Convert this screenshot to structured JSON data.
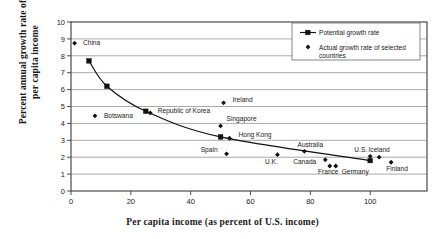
{
  "chart_data": {
    "type": "scatter",
    "title": "",
    "xlabel": "Per capita income (as percent of U.S. income)",
    "ylabel_line1": "Percent annual growth rate of",
    "ylabel_line2": "per capita income",
    "xlim": [
      0,
      119
    ],
    "ylim": [
      0,
      10
    ],
    "xticks": [
      0,
      20,
      40,
      60,
      80,
      100
    ],
    "yticks": [
      0,
      1,
      2,
      3,
      4,
      5,
      6,
      7,
      8,
      9,
      10
    ],
    "grid": "horizontal",
    "legend_position": "top-right",
    "series": [
      {
        "name": "Potential growth rate",
        "marker": "square",
        "line": true,
        "points": [
          {
            "x": 6,
            "y": 7.7
          },
          {
            "x": 12,
            "y": 6.2
          },
          {
            "x": 25,
            "y": 4.72
          },
          {
            "x": 50,
            "y": 3.2
          },
          {
            "x": 100,
            "y": 1.8
          }
        ]
      },
      {
        "name": "Actual growth rate of selected countries",
        "marker": "diamond",
        "line": false,
        "points": [
          {
            "label": "China",
            "x": 1.2,
            "y": 8.75,
            "lx": 4,
            "ly": 8.75,
            "anchor": "start"
          },
          {
            "label": "Botswana",
            "x": 8,
            "y": 4.45,
            "lx": 11,
            "ly": 4.45,
            "anchor": "start"
          },
          {
            "label": "Republic of Korea",
            "x": 26.5,
            "y": 4.62,
            "lx": 29,
            "ly": 4.78,
            "anchor": "start"
          },
          {
            "label": "Ireland",
            "x": 51,
            "y": 5.22,
            "lx": 54,
            "ly": 5.42,
            "anchor": "start"
          },
          {
            "label": "Singapore",
            "x": 50,
            "y": 3.85,
            "lx": 52,
            "ly": 4.25,
            "anchor": "start"
          },
          {
            "label": "Hong Kong",
            "x": 53,
            "y": 3.12,
            "lx": 56,
            "ly": 3.33,
            "anchor": "start"
          },
          {
            "label": "Spain",
            "x": 52,
            "y": 2.2,
            "lx": 49,
            "ly": 2.42,
            "anchor": "end"
          },
          {
            "label": "U.K.",
            "x": 69,
            "y": 2.15,
            "lx": 67,
            "ly": 1.75,
            "anchor": "middle"
          },
          {
            "label": "Australia",
            "x": 78,
            "y": 2.35,
            "lx": 80,
            "ly": 2.72,
            "anchor": "middle"
          },
          {
            "label": "Canada",
            "x": 85,
            "y": 1.85,
            "lx": 82,
            "ly": 1.72,
            "anchor": "end"
          },
          {
            "label": "France",
            "x": 86.5,
            "y": 1.48,
            "lx": 86,
            "ly": 1.12,
            "anchor": "middle"
          },
          {
            "label": "Germany",
            "x": 88.5,
            "y": 1.48,
            "lx": 95,
            "ly": 1.12,
            "anchor": "middle"
          },
          {
            "label": "U.S.",
            "x": 100,
            "y": 2.05,
            "lx": 99,
            "ly": 2.42,
            "anchor": "end"
          },
          {
            "label": "Iceland",
            "x": 103,
            "y": 2.0,
            "lx": 103,
            "ly": 2.42,
            "anchor": "middle"
          },
          {
            "label": "Finland",
            "x": 107,
            "y": 1.7,
            "lx": 109,
            "ly": 1.32,
            "anchor": "middle"
          }
        ]
      }
    ],
    "legend": [
      {
        "label": "Potential growth rate",
        "marker": "line-square"
      },
      {
        "label": "Actual growth rate of selected",
        "label2": "countries",
        "marker": "diamond"
      }
    ],
    "colors": {
      "ink": "#111111",
      "grid": "#6e6e6e",
      "frame": "#3a3a3a"
    }
  }
}
